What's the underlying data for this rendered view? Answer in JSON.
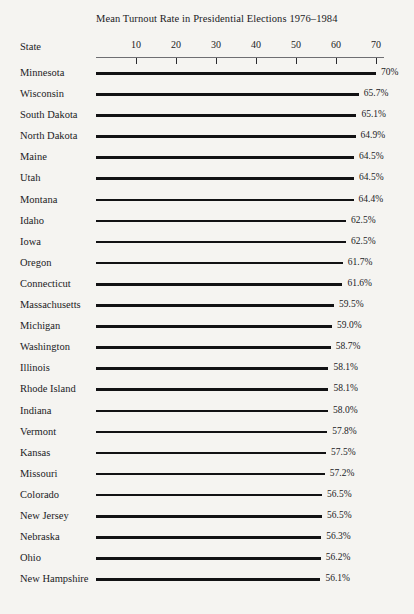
{
  "chart_data": {
    "type": "bar",
    "orientation": "horizontal",
    "title": "Mean Turnout Rate in Presidential Elections 1976–1984",
    "xlabel": "",
    "ylabel": "State",
    "category_header": "State",
    "xlim": [
      0,
      72
    ],
    "grid": false,
    "legend": null,
    "axis_position": "top",
    "tick_labels": [
      "10",
      "20",
      "30",
      "40",
      "50",
      "60",
      "70"
    ],
    "ticks": [
      10,
      20,
      30,
      40,
      50,
      60,
      70
    ],
    "value_suffix": "%",
    "categories": [
      "Minnesota",
      "Wisconsin",
      "South Dakota",
      "North Dakota",
      "Maine",
      "Utah",
      "Montana",
      "Idaho",
      "Iowa",
      "Oregon",
      "Connecticut",
      "Massachusetts",
      "Michigan",
      "Washington",
      "Illinois",
      "Rhode Island",
      "Indiana",
      "Vermont",
      "Kansas",
      "Missouri",
      "Colorado",
      "New Jersey",
      "Nebraska",
      "Ohio",
      "New Hampshire"
    ],
    "values": [
      70.0,
      65.7,
      65.1,
      64.9,
      64.5,
      64.5,
      64.4,
      62.5,
      62.5,
      61.7,
      61.6,
      59.5,
      59.0,
      58.7,
      58.1,
      58.1,
      58.0,
      57.8,
      57.5,
      57.2,
      56.5,
      56.5,
      56.3,
      56.2,
      56.1
    ],
    "value_labels": [
      "70%",
      "65.7%",
      "65.1%",
      "64.9%",
      "64.5%",
      "64.5%",
      "64.4%",
      "62.5%",
      "62.5%",
      "61.7%",
      "61.6%",
      "59.5%",
      "59.0%",
      "58.7%",
      "58.1%",
      "58.1%",
      "58.0%",
      "57.8%",
      "57.5%",
      "57.2%",
      "56.5%",
      "56.5%",
      "56.3%",
      "56.2%",
      "56.1%"
    ]
  },
  "colors": {
    "background": "#f5f4f1",
    "bar": "#121214",
    "axis": "#6e6e72",
    "text": "#1b1b1e"
  }
}
